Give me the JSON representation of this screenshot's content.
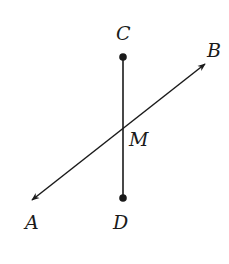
{
  "diagram": {
    "stroke_color": "#1a1a1a",
    "line_AB": {
      "type": "line",
      "endpoints": [
        "A",
        "B"
      ],
      "arrows": "both"
    },
    "segment_CD": {
      "type": "segment",
      "endpoints": [
        "C",
        "D"
      ]
    },
    "points": {
      "C": {
        "label": "C",
        "x": 123,
        "y": 57,
        "dot": true
      },
      "D": {
        "label": "D",
        "x": 123,
        "y": 198,
        "dot": true
      },
      "M": {
        "label": "M",
        "x": 123,
        "y": 127,
        "dot": false
      },
      "A": {
        "label": "A",
        "x": 31,
        "y": 201,
        "dot": false
      },
      "B": {
        "label": "B",
        "x": 206,
        "y": 63,
        "dot": false
      }
    }
  }
}
